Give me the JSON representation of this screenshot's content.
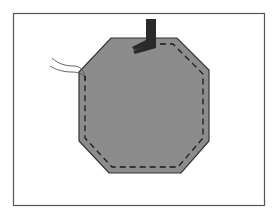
{
  "figure": {
    "frame": {
      "x": 13,
      "y": 13,
      "width": 252,
      "height": 193,
      "stroke": "#555555"
    },
    "fabric": {
      "shape": "octagon",
      "fill": "#8c8c8c",
      "stroke": "#333333",
      "points": [
        [
          111,
          38
        ],
        [
          177,
          38
        ],
        [
          209,
          70
        ],
        [
          209,
          141
        ],
        [
          181,
          173
        ],
        [
          109,
          173
        ],
        [
          79,
          141
        ],
        [
          79,
          72
        ]
      ]
    },
    "stitch_line": {
      "style": "dashed",
      "color": "#1a1a1a",
      "points": [
        [
          150,
          44
        ],
        [
          173,
          44
        ],
        [
          203,
          74
        ],
        [
          203,
          138
        ],
        [
          178,
          167
        ],
        [
          112,
          167
        ],
        [
          85,
          138
        ],
        [
          85,
          78
        ]
      ]
    },
    "presser_foot": {
      "color": "#2a2a2a",
      "shank": {
        "x": 146,
        "y": 19,
        "width": 10,
        "height": 27
      }
    },
    "thread_tails": {
      "color": "#555555",
      "count": 2
    }
  }
}
